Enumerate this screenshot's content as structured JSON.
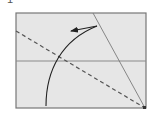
{
  "diagram": {
    "type": "origami-fold-step",
    "step_number": "1",
    "colors": {
      "paper": "#e6e6e6",
      "border": "#777777",
      "crease": "#8a8a8a",
      "fold_line": "#555555",
      "arrow": "#222222"
    },
    "paper": {
      "x": 16,
      "y": 13,
      "width": 130,
      "height": 95
    },
    "lines": [
      {
        "name": "horizontal-crease",
        "style": "solid",
        "x1": 16,
        "y1": 61,
        "x2": 146,
        "y2": 61
      },
      {
        "name": "diagonal-crease",
        "style": "solid",
        "x1": 93,
        "y1": 13,
        "x2": 145,
        "y2": 108
      },
      {
        "name": "valley-fold-line",
        "style": "dashed",
        "x1": 16,
        "y1": 31,
        "x2": 145,
        "y2": 108
      }
    ],
    "arrow": {
      "name": "fold-direction-arrow",
      "from": [
        46,
        106
      ],
      "to": [
        70,
        31
      ],
      "direction": "up-left"
    }
  }
}
